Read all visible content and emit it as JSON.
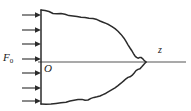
{
  "figure": {
    "kind": "line-diagram",
    "background_color": "#ffffff",
    "line_color": "#2b2b2b",
    "axis_color": "#8d8d8d",
    "labels": {
      "force": "F",
      "force_subscript": "0",
      "origin": "O",
      "axis": "z"
    },
    "axis": {
      "name": "z-axis",
      "orientation": "horizontal",
      "x_start": 38,
      "x_end": 186,
      "y": 62
    },
    "origin_point": {
      "x": 41,
      "y": 62
    },
    "arrows": {
      "name": "load-arrows",
      "count": 7,
      "direction": "right",
      "x_tail": 22,
      "x_head": 41,
      "y_positions": [
        15,
        30,
        44,
        59,
        73,
        88,
        101
      ]
    },
    "curve": {
      "name": "body-outline",
      "closed": true,
      "left_edge_x": 41,
      "top_y": 10,
      "bottom_y": 104,
      "tip_x": 146,
      "tip_y": 62,
      "upper_points": [
        [
          41,
          10
        ],
        [
          48,
          11
        ],
        [
          56,
          14
        ],
        [
          64,
          14
        ],
        [
          72,
          16
        ],
        [
          80,
          17
        ],
        [
          88,
          18
        ],
        [
          96,
          19
        ],
        [
          103,
          22
        ],
        [
          110,
          25
        ],
        [
          116,
          29
        ],
        [
          122,
          35
        ],
        [
          127,
          42
        ],
        [
          131,
          49
        ],
        [
          134,
          54
        ],
        [
          136,
          57
        ],
        [
          139,
          58
        ],
        [
          142,
          57
        ],
        [
          144,
          59
        ],
        [
          146,
          62
        ]
      ],
      "lower_points": [
        [
          41,
          104
        ],
        [
          50,
          104
        ],
        [
          58,
          103
        ],
        [
          66,
          102
        ],
        [
          74,
          100
        ],
        [
          82,
          99
        ],
        [
          88,
          100
        ],
        [
          94,
          97
        ],
        [
          100,
          96
        ],
        [
          106,
          93
        ],
        [
          111,
          90
        ],
        [
          116,
          87
        ],
        [
          121,
          83
        ],
        [
          125,
          79
        ],
        [
          129,
          77
        ],
        [
          133,
          74
        ],
        [
          136,
          70
        ],
        [
          140,
          69
        ],
        [
          143,
          65
        ],
        [
          146,
          62
        ]
      ]
    }
  }
}
